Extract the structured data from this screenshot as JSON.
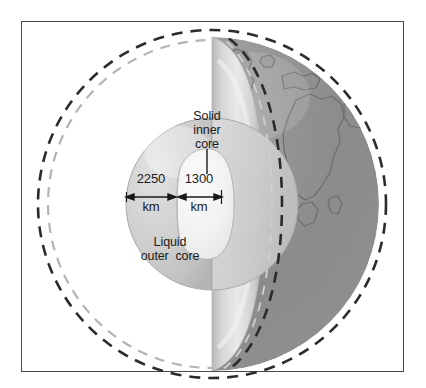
{
  "figure": {
    "frame": {
      "border_color": "#4a4a4a",
      "background": "#ffffff"
    }
  },
  "labels": {
    "solid_inner_core": "Solid\ninner\ncore",
    "liquid_outer_core": "Liquid\nouter  core"
  },
  "measurements": [
    {
      "name": "outer-core-radius",
      "value": "2250",
      "unit": "km",
      "describes": "Liquid outer core radial thickness"
    },
    {
      "name": "inner-core-radius",
      "value": "1300",
      "unit": "km",
      "describes": "Solid inner core radius"
    }
  ],
  "colors": {
    "frame_border": "#4a4a4a",
    "outer_dashed_circle": "#2b2b2b",
    "inner_dashed_circle": "#b0b0b0",
    "earth_surface_dark": "#8b8b8b",
    "earth_surface_light": "#cfcfcf",
    "mantle_band": "#d8d8d8",
    "outer_core_fill": "#cdcdcd",
    "inner_core_fill": "#f2f2f2",
    "continent_outline": "#6a6a6a",
    "text": "#1a1a1a",
    "leader_line": "#1a1a1a",
    "arrow": "#1a1a1a"
  },
  "geometry": {
    "cut_plane_x": 212,
    "sphere_center": {
      "x": 212,
      "y": 204
    },
    "sphere_radius": 167,
    "outer_core_radius_px": 86,
    "inner_core_radius_px": 44
  }
}
